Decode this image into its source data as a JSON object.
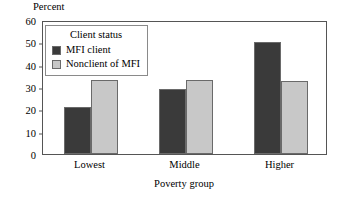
{
  "chart_data": {
    "type": "bar",
    "title": "",
    "categories": [
      "Lowest",
      "Middle",
      "Higher"
    ],
    "series": [
      {
        "name": "MFI client",
        "values": [
          21,
          29,
          50
        ],
        "color": "#3a3a3a"
      },
      {
        "name": "Nonclient of MFI",
        "values": [
          33,
          33,
          32.7
        ],
        "color": "#c8c8c8"
      }
    ],
    "xlabel": "Poverty group",
    "ylabel": "Percent",
    "ylim": [
      0,
      60
    ],
    "yticks": [
      0,
      10,
      20,
      30,
      40,
      50,
      60
    ],
    "ytick_labels": [
      "0",
      "10",
      "20",
      "30",
      "40",
      "50",
      "60"
    ],
    "grid": false,
    "legend_position": "upper-left",
    "legend_title": "Client status"
  },
  "axes": {
    "y_title": "Percent",
    "x_title": "Poverty group"
  },
  "legend": {
    "title": "Client status",
    "entries": [
      {
        "label": "MFI client",
        "color": "#3a3a3a"
      },
      {
        "label": "Nonclient of MFI",
        "color": "#c8c8c8"
      }
    ]
  },
  "colors": {
    "mfi_client": "#3a3a3a",
    "nonclient": "#c8c8c8",
    "frame": "#555555",
    "bar_outline": "#6a6a6a",
    "background": "#ffffff"
  }
}
